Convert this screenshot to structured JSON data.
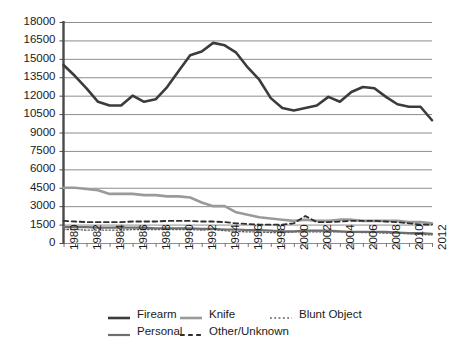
{
  "chart_data": {
    "type": "line",
    "title": "",
    "xlabel": "",
    "ylabel": "",
    "ylim": [
      0,
      18000
    ],
    "ytick_step": 1500,
    "grid": true,
    "legend_position": "bottom",
    "yticks": [
      "18000",
      "16500",
      "15000",
      "13500",
      "12000",
      "10500",
      "9000",
      "7500",
      "6000",
      "4500",
      "3000",
      "1500",
      "0"
    ],
    "x": [
      1980,
      1981,
      1982,
      1983,
      1984,
      1985,
      1986,
      1987,
      1988,
      1989,
      1990,
      1991,
      1992,
      1993,
      1994,
      1995,
      1996,
      1997,
      1998,
      1999,
      2000,
      2001,
      2002,
      2003,
      2004,
      2005,
      2006,
      2007,
      2008,
      2009,
      2010,
      2011,
      2012
    ],
    "xtick_labels": [
      "1980",
      "1982",
      "1984",
      "1986",
      "1988",
      "1990",
      "1992",
      "1994",
      "1996",
      "1998",
      "2000",
      "2002",
      "2004",
      "2006",
      "2008",
      "2010",
      "2012"
    ],
    "series": [
      {
        "name": "Firearm",
        "color": "#3b3b3b",
        "style": "solid",
        "width": 2.6,
        "values": [
          14500,
          13600,
          12600,
          11500,
          11200,
          11200,
          12000,
          11500,
          11700,
          12700,
          14000,
          15300,
          15600,
          16300,
          16100,
          15500,
          14300,
          13300,
          11800,
          11000,
          10800,
          11000,
          11200,
          11900,
          11500,
          12300,
          12700,
          12600,
          11900,
          11300,
          11100,
          11100,
          10000
        ]
      },
      {
        "name": "Knife",
        "color": "#9a9a9a",
        "style": "solid",
        "width": 2.6,
        "values": [
          4500,
          4500,
          4400,
          4300,
          4000,
          4000,
          4000,
          3900,
          3900,
          3800,
          3800,
          3700,
          3300,
          3000,
          3000,
          2500,
          2300,
          2100,
          2000,
          1900,
          1800,
          1900,
          1800,
          1800,
          1900,
          1900,
          1800,
          1800,
          1800,
          1800,
          1700,
          1700,
          1600
        ]
      },
      {
        "name": "Blunt Object",
        "color": "#5a5a5a",
        "style": "dotted",
        "width": 1.3,
        "values": [
          1100,
          1100,
          1050,
          1050,
          1050,
          1050,
          1100,
          1100,
          1100,
          1100,
          1100,
          1100,
          1050,
          1100,
          1000,
          950,
          900,
          900,
          850,
          850,
          900,
          900,
          900,
          900,
          900,
          900,
          850,
          850,
          800,
          800,
          750,
          700,
          650
        ]
      },
      {
        "name": "Personal",
        "color": "#6e6e6e",
        "style": "solid",
        "width": 2.2,
        "values": [
          1300,
          1300,
          1300,
          1250,
          1250,
          1250,
          1250,
          1250,
          1200,
          1200,
          1200,
          1200,
          1150,
          1150,
          1100,
          1100,
          1050,
          1050,
          1000,
          950,
          950,
          1000,
          1000,
          1000,
          950,
          900,
          900,
          900,
          900,
          850,
          800,
          800,
          750
        ]
      },
      {
        "name": "Other/Unknown",
        "color": "#2f2f2f",
        "style": "dashed",
        "width": 1.8,
        "values": [
          1800,
          1750,
          1700,
          1700,
          1700,
          1700,
          1750,
          1750,
          1750,
          1800,
          1800,
          1800,
          1750,
          1750,
          1700,
          1600,
          1550,
          1500,
          1500,
          1500,
          1600,
          2200,
          1700,
          1700,
          1750,
          1800,
          1800,
          1800,
          1750,
          1700,
          1600,
          1500,
          1500
        ]
      }
    ]
  },
  "legend": {
    "rows": [
      [
        {
          "label": "Firearm",
          "series": "Firearm"
        },
        {
          "label": "Knife",
          "series": "Knife"
        },
        {
          "label": "Blunt Object",
          "series": "Blunt Object"
        }
      ],
      [
        {
          "label": "Personal",
          "series": "Personal"
        },
        {
          "label": "Other/Unknown",
          "series": "Other/Unknown"
        }
      ]
    ],
    "firearm_label": "Firearm",
    "knife_label": "Knife",
    "blunt_label": "Blunt Object",
    "personal_label": "Personal",
    "other_label": "Other/Unknown"
  }
}
